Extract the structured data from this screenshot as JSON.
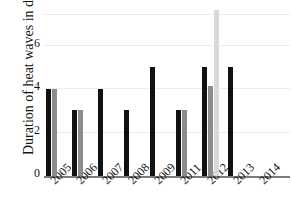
{
  "chart_data": {
    "type": "bar",
    "title": "",
    "xlabel": "",
    "ylabel": "Duration of heat waves in days",
    "categories": [
      "2005",
      "2006",
      "2007",
      "2008",
      "2009",
      "2011",
      "2012",
      "2013",
      "2014"
    ],
    "ylim": [
      0,
      7.6
    ],
    "yticks": [
      0,
      2,
      4,
      6
    ],
    "ytick_labels": [
      "0",
      "2",
      "4",
      "6"
    ],
    "grid": true,
    "legend": "none",
    "series": [
      {
        "name": "series-1",
        "color": "#111111",
        "values": [
          4,
          3,
          4,
          3,
          5,
          3,
          5,
          5,
          null
        ]
      },
      {
        "name": "series-2",
        "color": "#8c8c8c",
        "values": [
          4,
          3,
          null,
          null,
          null,
          3,
          4.1,
          null,
          null
        ]
      },
      {
        "name": "series-3",
        "color": "#d9d9d9",
        "values": [
          null,
          null,
          null,
          null,
          null,
          null,
          7.6,
          null,
          null
        ]
      }
    ]
  },
  "axis": {
    "y_title": "Duration of heat waves in days",
    "tick_0": "0",
    "tick_2": "2",
    "tick_4": "4",
    "tick_6": "6"
  },
  "xaxis": {
    "labels": [
      "2005",
      "2006",
      "2007",
      "2008",
      "2009",
      "2011",
      "2012",
      "2013",
      "2014"
    ]
  },
  "title": {
    "text": ""
  },
  "colors": {
    "series_1": "#111111",
    "series_2": "#8c8c8c",
    "series_3": "#d9d9d9",
    "gridline": "#ececed",
    "axis": "#7b7b7b",
    "text": "#141414",
    "background": "#ffffff"
  }
}
